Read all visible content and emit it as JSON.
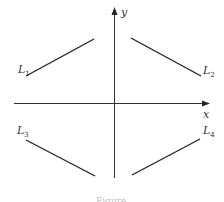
{
  "figure": {
    "axes": {
      "x_label": "x",
      "y_label": "y"
    },
    "lines": [
      {
        "name": "L",
        "sub": "1",
        "slope": "positive",
        "quadrant": "upper-left"
      },
      {
        "name": "L",
        "sub": "2",
        "slope": "negative",
        "quadrant": "upper-right"
      },
      {
        "name": "L",
        "sub": "3",
        "slope": "negative",
        "quadrant": "lower-left"
      },
      {
        "name": "L",
        "sub": "4",
        "slope": "positive",
        "quadrant": "lower-right"
      }
    ],
    "caption": "Figure"
  }
}
